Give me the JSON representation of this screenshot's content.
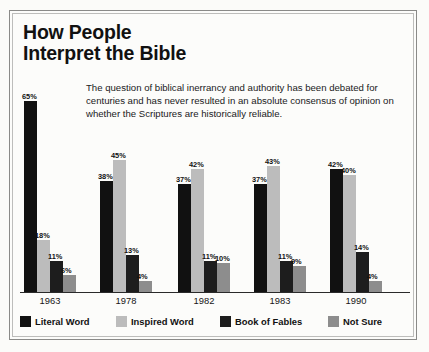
{
  "title": "How People\nInterpret the Bible",
  "description": "The question of biblical inerrancy and authority has been debated for centuries and has never resulted in an absolute consensus of opinion on whether the Scriptures are historically reliable.",
  "colors": {
    "literal_word": "#111111",
    "inspired_word": "#bcbcbc",
    "book_of_fables": "#1d1d1d",
    "not_sure": "#8d8d8d",
    "background": "#fbfbf9",
    "frame": "#8a8a88"
  },
  "chart_data": {
    "type": "bar",
    "title": "How People Interpret the Bible",
    "subtitle": "The question of biblical inerrancy and authority has been debated for centuries and has never resulted in an absolute consensus of opinion on whether the Scriptures are historically reliable.",
    "xlabel": "",
    "ylabel": "",
    "ylim": [
      0,
      70
    ],
    "grid": false,
    "legend_position": "bottom",
    "categories": [
      "1963",
      "1978",
      "1982",
      "1983",
      "1990"
    ],
    "series": [
      {
        "name": "Literal Word",
        "color": "#111111",
        "values": [
          65,
          38,
          37,
          37,
          42
        ],
        "labels": [
          "65%",
          "38%",
          "37%",
          "37%",
          "42%"
        ]
      },
      {
        "name": "Inspired Word",
        "color": "#bcbcbc",
        "values": [
          18,
          45,
          42,
          43,
          40
        ],
        "labels": [
          "18%",
          "45%",
          "42%",
          "43%",
          "40%"
        ]
      },
      {
        "name": "Book of Fables",
        "color": "#1d1d1d",
        "values": [
          11,
          13,
          11,
          11,
          14
        ],
        "labels": [
          "11%",
          "13%",
          "11%",
          "11%",
          "14%"
        ]
      },
      {
        "name": "Not Sure",
        "color": "#8d8d8d",
        "values": [
          6,
          4,
          10,
          9,
          4
        ],
        "labels": [
          "6%",
          "4%",
          "10%",
          "9%",
          "4%"
        ]
      }
    ]
  },
  "legend": [
    {
      "label": "Literal Word",
      "color": "#111111"
    },
    {
      "label": "Inspired Word",
      "color": "#bcbcbc"
    },
    {
      "label": "Book of Fables",
      "color": "#1d1d1d"
    },
    {
      "label": "Not Sure",
      "color": "#8d8d8d"
    }
  ]
}
